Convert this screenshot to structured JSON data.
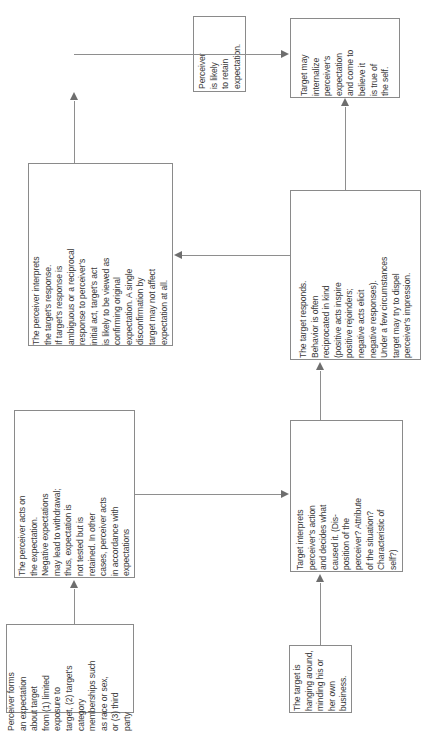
{
  "diagram": {
    "orientation": "rotated-90-ccw",
    "page_background": "#ffffff",
    "box_border_color": "#8a8a8a",
    "connector_color": "#8e8e8e",
    "text_color": "#3a3a3a",
    "nodes": [
      {
        "id": "n1",
        "name": "perceiver-forms-expectation",
        "text": "Perceiver forms\nan expectation\nabout target\nfrom (1) limited\nexposure to\ntarget, (2) target's\ncategory\nmemberships such\nas race or sex,\nor (3) third\nparty"
      },
      {
        "id": "n2",
        "name": "perceiver-acts-on-expectation",
        "text": "The perceiver acts on\nthe expectation.\nNegative expectations\nmay lead to withdrawal;\nthus, expectation is\nnot tested but is\nretained. In other\ncases, perceiver acts\nin accordance with\nexpectations"
      },
      {
        "id": "n3",
        "name": "perceiver-interprets-response",
        "text": "The perceiver interprets\nthe target's response.\nIf target's response is\nambiguous or a reciprocal\nresponse to perceiver's\ninitial act, target's act\nis likely to be viewed as\nconfirming original\nexpectation. A single\ndisconfirmation by\ntarget may not affect\nexpectation at all."
      },
      {
        "id": "n4",
        "name": "perceiver-retains-expectation",
        "text": "Perceiver\nis likely\nto retain\nexpectation."
      },
      {
        "id": "n5",
        "name": "target-hanging-around",
        "text": "The target is\nhanging around,\nminding his or\nher own\nbusiness."
      },
      {
        "id": "n6",
        "name": "target-interprets-perceiver-action",
        "text": "Target interprets\nperceiver's action\nand decides what\ncaused it. (Dis-\nposition of the\nperceiver? Attribute\nof the situation?\nCharacteristic of\nself?)"
      },
      {
        "id": "n7",
        "name": "target-responds",
        "text": "The target responds.\nBehavior is often\nreciprocated in kind\n(positive acts inspire\npositive rejoinders;\nnegative acts elicit\nnegative responses).\nUnder a few circumstances\ntarget may try to dispel\nperceiver's impression."
      },
      {
        "id": "n8",
        "name": "target-internalizes-expectation",
        "text": "Target may\ninternalize\nperceiver's\nexpectation\nand come to\nbelieve it\nis true of\nthe self."
      }
    ],
    "edges": [
      {
        "id": "e1",
        "name": "edge-perceiver-forms-to-perceiver-acts",
        "from": "n1",
        "to": "n2"
      },
      {
        "id": "e2",
        "name": "edge-perceiver-acts-to-target-interprets",
        "from": "n2",
        "to": "n6"
      },
      {
        "id": "e3",
        "name": "edge-target-hanging-to-target-interprets",
        "from": "n5",
        "to": "n6"
      },
      {
        "id": "e4",
        "name": "edge-target-interprets-to-target-responds",
        "from": "n6",
        "to": "n7"
      },
      {
        "id": "e5",
        "name": "edge-target-responds-to-perceiver-interprets",
        "from": "n7",
        "to": "n3"
      },
      {
        "id": "e6",
        "name": "edge-target-responds-to-target-internalizes",
        "from": "n7",
        "to": "n8"
      },
      {
        "id": "e7",
        "name": "edge-perceiver-interprets-to-perceiver-retains",
        "from": "n3",
        "to": "n4"
      },
      {
        "id": "e8",
        "name": "edge-perceiver-retains-to-target-internalizes",
        "from": "n4",
        "to": "n8"
      }
    ]
  }
}
